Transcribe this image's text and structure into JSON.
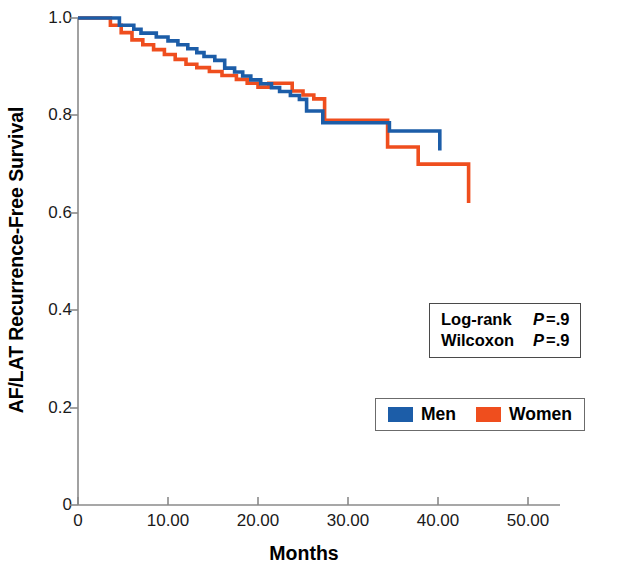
{
  "chart_data": {
    "type": "line",
    "subtype": "kaplan-meier-step",
    "title": "",
    "xlabel": "Months",
    "ylabel": "AF/LAT Recurrence-Free Survival",
    "xlim": [
      0,
      50
    ],
    "ylim": [
      0,
      1.0
    ],
    "xticks": [
      0,
      10,
      20,
      30,
      40,
      50
    ],
    "xtick_labels": [
      "0",
      "10.00",
      "20.00",
      "30.00",
      "40.00",
      "50.00"
    ],
    "yticks": [
      0,
      0.2,
      0.4,
      0.6,
      0.8,
      1.0
    ],
    "ytick_labels": [
      "0",
      "0.2",
      "0.4",
      "0.6",
      "0.8",
      "1.0"
    ],
    "grid": false,
    "legend_position": "lower-right-inside",
    "series": [
      {
        "name": "Men",
        "color": "#1c5da8",
        "x": [
          0.0,
          3.3,
          4.6,
          6.2,
          7.0,
          8.7,
          10.0,
          11.1,
          12.2,
          13.2,
          14.0,
          15.2,
          16.3,
          17.4,
          18.3,
          19.2,
          20.3,
          21.5,
          22.4,
          23.6,
          24.6,
          25.4,
          27.2,
          34.6,
          40.2
        ],
        "y": [
          1.0,
          1.0,
          0.985,
          0.977,
          0.969,
          0.961,
          0.953,
          0.945,
          0.937,
          0.929,
          0.921,
          0.913,
          0.897,
          0.889,
          0.881,
          0.873,
          0.865,
          0.857,
          0.849,
          0.841,
          0.833,
          0.809,
          0.785,
          0.768,
          0.728
        ],
        "final_value": 0.728,
        "end_x": 40.2
      },
      {
        "name": "Women",
        "color": "#ef4e1e",
        "x": [
          0.0,
          2.4,
          3.6,
          4.8,
          6.0,
          7.2,
          8.4,
          9.6,
          10.8,
          12.0,
          13.2,
          14.6,
          16.0,
          17.6,
          18.8,
          20.0,
          21.2,
          22.4,
          23.8,
          25.0,
          26.2,
          27.4,
          34.4,
          37.8,
          43.4
        ],
        "y": [
          1.0,
          1.0,
          0.985,
          0.97,
          0.955,
          0.945,
          0.935,
          0.925,
          0.915,
          0.905,
          0.898,
          0.89,
          0.882,
          0.874,
          0.866,
          0.858,
          0.866,
          0.866,
          0.85,
          0.842,
          0.834,
          0.79,
          0.735,
          0.7,
          0.62
        ],
        "final_value": 0.62,
        "end_x": 43.4
      }
    ],
    "annotations": [
      {
        "label": "Log-rank",
        "stat_symbol": "P",
        "relation": "=",
        "value": ".9"
      },
      {
        "label": "Wilcoxon",
        "stat_symbol": "P",
        "relation": "=",
        "value": ".9"
      }
    ]
  },
  "axes": {
    "y_title": "AF/LAT Recurrence-Free Survival",
    "x_title": "Months"
  },
  "stats_box": {
    "rows": [
      {
        "test": "Log-rank",
        "p_symbol": "P",
        "p_text": "=.9"
      },
      {
        "test": "Wilcoxon",
        "p_symbol": "P",
        "p_text": "=.9"
      }
    ]
  },
  "legend": {
    "entries": [
      {
        "label": "Men",
        "color": "#1c5da8"
      },
      {
        "label": "Women",
        "color": "#ef4e1e"
      }
    ]
  },
  "colors": {
    "men": "#1c5da8",
    "women": "#ef4e1e",
    "axis": "#808080",
    "text": "#000000"
  }
}
